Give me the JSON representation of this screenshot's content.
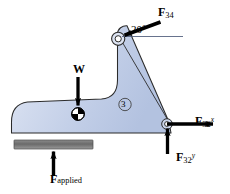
{
  "figure": {
    "background_color": "#ffffff",
    "body_fill_color": "#c3cfe6",
    "body_stroke_color": "#2b2b2b",
    "ground_bar_color": "#6e6e6e",
    "arrow_color": "#000000"
  },
  "labels": {
    "force_f34": {
      "symbol": "F",
      "sub": "34",
      "sup": ""
    },
    "force_f32x": {
      "symbol": "F",
      "sub": "32",
      "sup": "x"
    },
    "force_f32y": {
      "symbol": "F",
      "sub": "32",
      "sup": "y"
    },
    "weight": {
      "symbol": "W",
      "sub": "",
      "sup": ""
    },
    "force_applied": {
      "symbol": "F",
      "sub": "applied",
      "sup": ""
    },
    "angle": "20°",
    "link_number": "3"
  },
  "forces": [
    {
      "name": "F34",
      "label": "F34",
      "direction": "into-pivot-down-left",
      "angle_from_horizontal_deg": 20,
      "applied_at": "top-pivot"
    },
    {
      "name": "F32x",
      "label": "F32 superscript x",
      "direction": "right",
      "angle_from_horizontal_deg": 0,
      "applied_at": "bottom-right-pivot"
    },
    {
      "name": "F32y",
      "label": "F32 superscript y",
      "direction": "up",
      "angle_from_horizontal_deg": 90,
      "applied_at": "bottom-right-pivot"
    },
    {
      "name": "W",
      "label": "W",
      "direction": "down",
      "angle_from_horizontal_deg": -90,
      "applied_at": "center-of-gravity"
    },
    {
      "name": "Fapplied",
      "label": "F applied",
      "direction": "up",
      "angle_from_horizontal_deg": 90,
      "applied_at": "ground-bar"
    }
  ],
  "annotations": {
    "angle_reference": "horizontal reference line at top pivot",
    "center_of_gravity_marker": "quartered-circle cg symbol",
    "link_badge": "circled numeral 3"
  }
}
